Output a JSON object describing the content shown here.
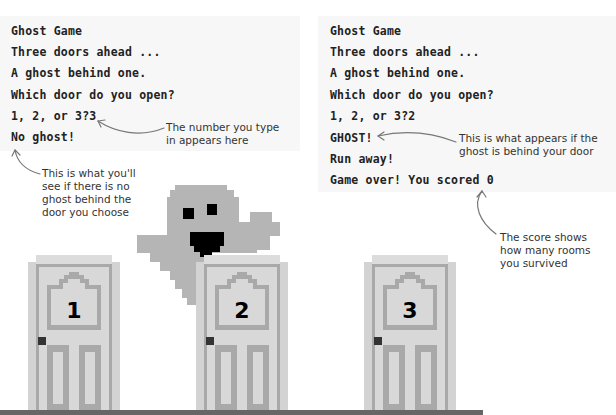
{
  "left_terminal": {
    "lines": [
      "Ghost Game",
      "Three doors ahead ...",
      "A ghost behind one.",
      "Which door do you open?",
      "1, 2, or 3?3",
      "No ghost!"
    ]
  },
  "right_terminal": {
    "lines": [
      "Ghost Game",
      "Three doors ahead ...",
      "A ghost behind one.",
      "Which door do you open?",
      "1, 2, or 3?2",
      "GHOST!",
      "Run away!",
      "Game over! You scored 0"
    ]
  },
  "annotations": {
    "number_typed": "The number you type\nin appears here",
    "no_ghost": "This is what you'll\nsee if there is no\nghost behind the\ndoor you choose",
    "ghost_found": "This is what appears if the\nghost is behind your door",
    "score": "The score shows\nhow many rooms\nyou survived"
  },
  "doors": [
    {
      "number": "1"
    },
    {
      "number": "2"
    },
    {
      "number": "3"
    }
  ],
  "colors": {
    "panel_bg": "#f7f7f7",
    "door_light": "#d3d3d3",
    "door_mid": "#a9a9a9",
    "ghost": "#b5b5b5",
    "floor": "#666666",
    "text": "#222222"
  }
}
